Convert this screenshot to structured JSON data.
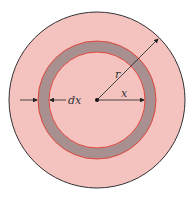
{
  "diagram": {
    "labels": {
      "radius": "r",
      "distance": "x",
      "thickness": "dx"
    },
    "colors": {
      "disk_fill": "#f4c3c0",
      "disk_edge": "#333333",
      "ring_fill": "#a89090",
      "ring_edge": "#e0483e",
      "arrow": "#222222"
    }
  }
}
